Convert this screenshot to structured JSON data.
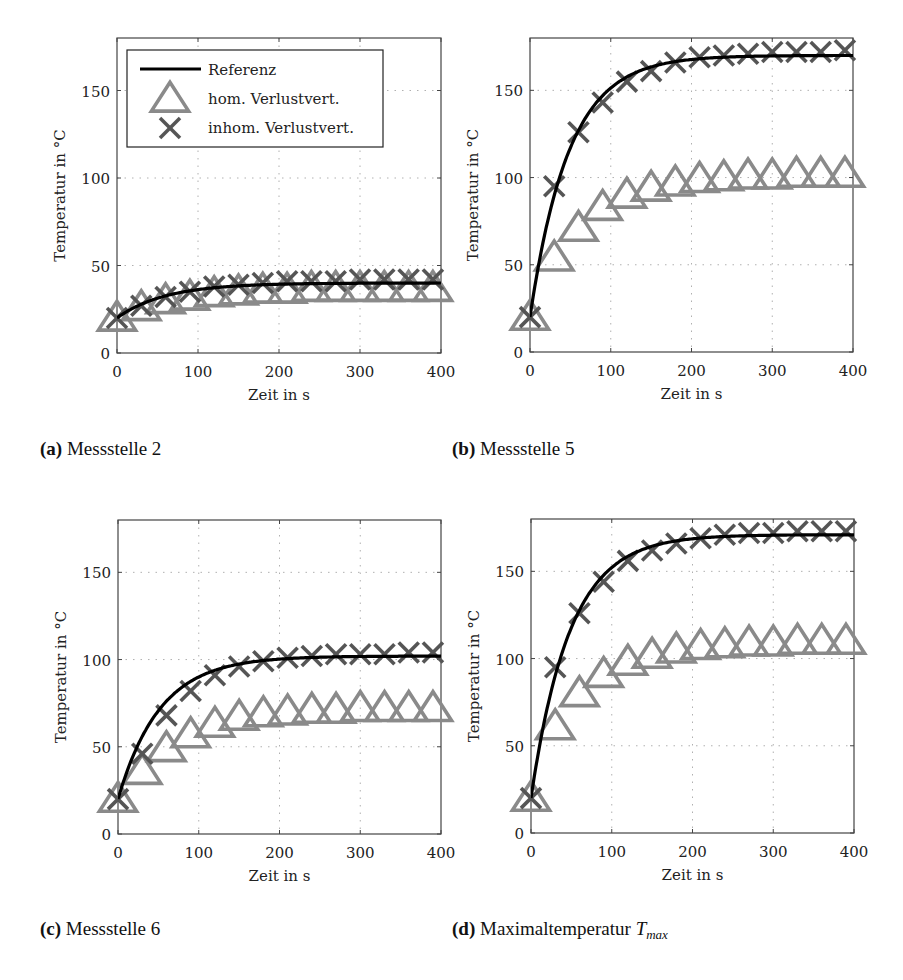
{
  "figure": {
    "captions": [
      {
        "label": "(a)",
        "text": "Messstelle 2"
      },
      {
        "label": "(b)",
        "text": "Messstelle 5"
      },
      {
        "label": "(c)",
        "text": "Messstelle 6"
      },
      {
        "label": "(d)",
        "text": "Maximaltemperatur",
        "math_base": "T",
        "math_sub": "max"
      }
    ],
    "legend": {
      "entries": [
        {
          "label": "Referenz",
          "marker": "line",
          "color": "#000000"
        },
        {
          "label": "hom. Verlustvert.",
          "marker": "triangle",
          "color": "#8a8a8a"
        },
        {
          "label": "inhom. Verlustvert.",
          "marker": "x",
          "color": "#555555"
        }
      ]
    },
    "axes": {
      "xlabel": "Zeit in s",
      "ylabel": "Temperatur in °C",
      "xticks": [
        0,
        100,
        200,
        300,
        400
      ],
      "yticks": [
        0,
        50,
        100,
        150
      ],
      "xlim": [
        0,
        400
      ],
      "ylim": [
        0,
        180
      ]
    }
  },
  "chart_data": [
    {
      "type": "line",
      "title": "(a) Messstelle 2",
      "xlabel": "Zeit in s",
      "ylabel": "Temperatur in °C",
      "xlim": [
        0,
        400
      ],
      "ylim": [
        0,
        180
      ],
      "grid": true,
      "legend_position": "upper left",
      "x_markers": [
        0,
        30,
        60,
        90,
        120,
        150,
        180,
        210,
        240,
        270,
        300,
        330,
        360,
        390
      ],
      "series": [
        {
          "name": "Referenz",
          "style": "line",
          "tau": 60,
          "start": 20,
          "end": 40
        },
        {
          "name": "hom. Verlustvert.",
          "style": "triangle",
          "values": [
            20,
            26,
            30,
            32,
            34,
            35,
            36,
            36,
            37,
            37,
            37,
            37,
            37,
            37
          ]
        },
        {
          "name": "inhom. Verlustvert.",
          "style": "x",
          "values": [
            20,
            27,
            32,
            35,
            38,
            39,
            40,
            41,
            41,
            41,
            42,
            42,
            42,
            42
          ]
        }
      ]
    },
    {
      "type": "line",
      "title": "(b) Messstelle 5",
      "xlabel": "Zeit in s",
      "ylabel": "Temperatur in °C",
      "xlim": [
        0,
        400
      ],
      "ylim": [
        0,
        180
      ],
      "grid": true,
      "x_markers": [
        0,
        30,
        60,
        90,
        120,
        150,
        180,
        210,
        240,
        270,
        300,
        330,
        360,
        390
      ],
      "series": [
        {
          "name": "Referenz",
          "style": "line",
          "tau": 48,
          "start": 20,
          "end": 170
        },
        {
          "name": "hom. Verlustvert.",
          "style": "triangle",
          "values": [
            20,
            54,
            71,
            83,
            90,
            94,
            97,
            99,
            100,
            101,
            101,
            102,
            102,
            102
          ]
        },
        {
          "name": "inhom. Verlustvert.",
          "style": "x",
          "values": [
            20,
            95,
            126,
            143,
            155,
            161,
            166,
            169,
            170,
            171,
            172,
            172,
            172,
            173
          ]
        }
      ]
    },
    {
      "type": "line",
      "title": "(c) Messstelle 6",
      "xlabel": "Zeit in s",
      "ylabel": "Temperatur in °C",
      "xlim": [
        0,
        400
      ],
      "ylim": [
        0,
        180
      ],
      "grid": true,
      "x_markers": [
        0,
        30,
        60,
        90,
        120,
        150,
        180,
        210,
        240,
        270,
        300,
        330,
        360,
        390
      ],
      "series": [
        {
          "name": "Referenz",
          "style": "line",
          "tau": 52,
          "start": 20,
          "end": 102
        },
        {
          "name": "hom. Verlustvert.",
          "style": "triangle",
          "values": [
            20,
            36,
            49,
            57,
            63,
            67,
            69,
            70,
            71,
            71,
            72,
            72,
            72,
            72
          ]
        },
        {
          "name": "inhom. Verlustvert.",
          "style": "x",
          "values": [
            20,
            46,
            68,
            82,
            91,
            96,
            99,
            101,
            102,
            103,
            103,
            103,
            104,
            104
          ]
        }
      ]
    },
    {
      "type": "line",
      "title": "(d) Maximaltemperatur T_max",
      "xlabel": "Zeit in s",
      "ylabel": "Temperatur in °C",
      "xlim": [
        0,
        400
      ],
      "ylim": [
        0,
        180
      ],
      "grid": true,
      "x_markers": [
        0,
        30,
        60,
        90,
        120,
        150,
        180,
        210,
        240,
        270,
        300,
        330,
        360,
        390
      ],
      "series": [
        {
          "name": "Referenz",
          "style": "line",
          "tau": 48,
          "start": 20,
          "end": 171
        },
        {
          "name": "hom. Verlustvert.",
          "style": "triangle",
          "values": [
            20,
            61,
            80,
            91,
            98,
            102,
            105,
            107,
            108,
            109,
            109,
            110,
            110,
            110
          ]
        },
        {
          "name": "inhom. Verlustvert.",
          "style": "x",
          "values": [
            20,
            95,
            126,
            144,
            156,
            162,
            166,
            169,
            171,
            172,
            172,
            173,
            173,
            173
          ]
        }
      ]
    }
  ]
}
